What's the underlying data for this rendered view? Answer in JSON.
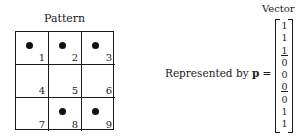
{
  "pattern": {
    "title": "Pattern",
    "cells": [
      {
        "number": "1",
        "filled": true
      },
      {
        "number": "2",
        "filled": true
      },
      {
        "number": "3",
        "filled": true
      },
      {
        "number": "4",
        "filled": false
      },
      {
        "number": "5",
        "filled": false
      },
      {
        "number": "6",
        "filled": false
      },
      {
        "number": "7",
        "filled": false
      },
      {
        "number": "8",
        "filled": true
      },
      {
        "number": "9",
        "filled": true
      }
    ]
  },
  "vector": {
    "title": "Vector",
    "label_prefix": "Represented by ",
    "symbol": "p",
    "equals": " =",
    "values": [
      "1",
      "1",
      "1",
      "0",
      "0",
      "0",
      "0",
      "1",
      "1"
    ],
    "underlined_indices": [
      2,
      5
    ]
  }
}
